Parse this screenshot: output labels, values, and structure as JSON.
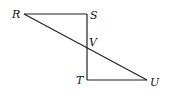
{
  "diagram": {
    "type": "geometry-figure",
    "points": {
      "R": {
        "label": "R",
        "x": 24,
        "y": 14
      },
      "S": {
        "label": "S",
        "x": 87,
        "y": 14
      },
      "V": {
        "label": "V",
        "x": 87,
        "y": 47
      },
      "T": {
        "label": "T",
        "x": 87,
        "y": 80
      },
      "U": {
        "label": "U",
        "x": 147,
        "y": 80
      }
    },
    "segments": [
      {
        "from": "R",
        "to": "S"
      },
      {
        "from": "S",
        "to": "T"
      },
      {
        "from": "T",
        "to": "U"
      },
      {
        "from": "R",
        "to": "U"
      }
    ],
    "colors": {
      "line": "#222222",
      "background": "#ffffff"
    }
  }
}
